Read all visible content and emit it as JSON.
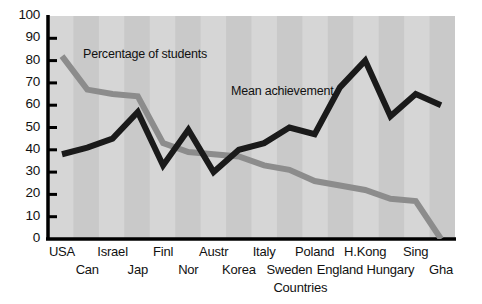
{
  "chart_data": {
    "type": "line",
    "title": "",
    "xlabel": "Countries",
    "ylabel": "",
    "ylim": [
      0,
      100
    ],
    "yticks": [
      0,
      10,
      20,
      30,
      40,
      50,
      60,
      70,
      80,
      90,
      100
    ],
    "grid": false,
    "legend_position": "inline-annotations",
    "categories": [
      "USA",
      "Can",
      "Israel",
      "Jap",
      "Finl",
      "Nor",
      "Austr",
      "Korea",
      "Italy",
      "Sweden",
      "Poland",
      "England",
      "H.Kong",
      "Hungary",
      "Sing",
      "Gha"
    ],
    "categories_top_row": [
      "USA",
      "Israel",
      "Finl",
      "Austr",
      "Italy",
      "Poland",
      "H.Kong",
      "Sing"
    ],
    "categories_bottom_row": [
      "Can",
      "Jap",
      "Nor",
      "Korea",
      "Sweden",
      "England",
      "Hungary",
      "Gha"
    ],
    "series": [
      {
        "name": "Percentage of students",
        "color": "#8c8c8c",
        "values": [
          82,
          67,
          65,
          64,
          43,
          39,
          38,
          37,
          33,
          31,
          26,
          24,
          22,
          18,
          17,
          0
        ]
      },
      {
        "name": "Mean achievement",
        "color": "#1a1a1a",
        "values": [
          38,
          41,
          45,
          57,
          33,
          49,
          30,
          40,
          43,
          50,
          47,
          68,
          80,
          55,
          65,
          60
        ]
      }
    ],
    "annotations": [
      {
        "text": "Percentage of students",
        "x_px": 83,
        "y_px": 47
      },
      {
        "text": "Mean achievement",
        "x_px": 231,
        "y_px": 84
      }
    ]
  },
  "plot_area": {
    "left_px": 48,
    "right_px": 455,
    "top_px": 16,
    "bottom_px": 239,
    "background_band_light": "#d6d6d6",
    "background_band_dark": "#c9c9c9",
    "axis_color": "#000000"
  }
}
